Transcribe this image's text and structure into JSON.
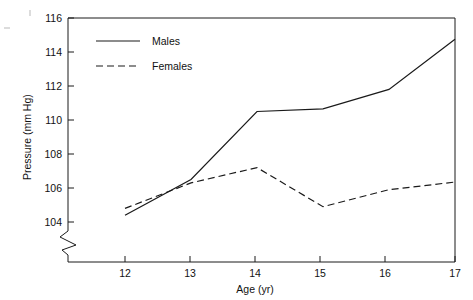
{
  "chart_data": {
    "type": "line",
    "title": "",
    "xlabel": "Age (yr)",
    "ylabel": "Pressure (mm Hg)",
    "x": [
      12,
      13,
      14,
      15,
      16,
      17
    ],
    "xtick_labels": [
      "12",
      "13",
      "14",
      "15",
      "16",
      "17"
    ],
    "ytick_labels": [
      "104",
      "106",
      "108",
      "110",
      "112",
      "114",
      "116"
    ],
    "ytick_values": [
      104,
      106,
      108,
      110,
      112,
      114,
      116
    ],
    "xlim": [
      11.2,
      17.0
    ],
    "ylim": [
      103.4,
      116.0
    ],
    "y_axis_break": true,
    "grid": false,
    "legend_position": "top-left",
    "series": [
      {
        "name": "Males",
        "style": "solid",
        "color": "#1a1a1a",
        "values": [
          104.4,
          106.5,
          110.5,
          110.65,
          111.8,
          114.75
        ]
      },
      {
        "name": "Females",
        "style": "dashed",
        "color": "#1a1a1a",
        "values": [
          104.8,
          106.3,
          107.2,
          104.9,
          105.9,
          106.35
        ]
      }
    ]
  },
  "legend": {
    "entries": [
      {
        "label": "Males",
        "style": "solid"
      },
      {
        "label": "Females",
        "style": "dashed"
      }
    ]
  },
  "axes": {
    "x_title": "Age (yr)",
    "y_title": "Pressure (mm Hg)"
  }
}
